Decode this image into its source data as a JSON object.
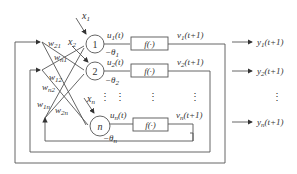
{
  "inputs": [
    "x1",
    "x2",
    "xn"
  ],
  "input_labels": [
    {
      "base": "x",
      "sub": "1"
    },
    {
      "base": "x",
      "sub": "2"
    },
    {
      "base": "x",
      "sub": "n"
    }
  ],
  "neurons": [
    {
      "label": "1",
      "u": {
        "base": "u",
        "sub": "1",
        "arg": "(t)"
      },
      "theta": {
        "base": "−θ",
        "sub": "1"
      },
      "f": "f(·)",
      "v": {
        "base": "v",
        "sub": "1",
        "arg": "(t+1)"
      },
      "y": {
        "base": "y",
        "sub": "1",
        "arg": "(t+1)"
      }
    },
    {
      "label": "2",
      "u": {
        "base": "u",
        "sub": "2",
        "arg": "(t)"
      },
      "theta": {
        "base": "−θ",
        "sub": "2"
      },
      "f": "f(·)",
      "v": {
        "base": "v",
        "sub": "2",
        "arg": "(t+1)"
      },
      "y": {
        "base": "y",
        "sub": "2",
        "arg": "(t+1)"
      }
    },
    {
      "label": "n",
      "u": {
        "base": "u",
        "sub": "n",
        "arg": "(t)"
      },
      "theta": {
        "base": "−θ",
        "sub": "n"
      },
      "f": "f(·)",
      "v": {
        "base": "v",
        "sub": "n",
        "arg": "(t+1)"
      },
      "y": {
        "base": "y",
        "sub": "n",
        "arg": "(t+1)"
      }
    }
  ],
  "weights": [
    {
      "base": "w",
      "sub": "21"
    },
    {
      "base": "w",
      "sub": "n1"
    },
    {
      "base": "w",
      "sub": "12"
    },
    {
      "base": "w",
      "sub": "n2"
    },
    {
      "base": "w",
      "sub": "1n"
    },
    {
      "base": "w",
      "sub": "2n"
    }
  ],
  "ellipsis": "⋮",
  "colors": {
    "line": "#555555",
    "text": "#333333",
    "background": "#ffffff"
  }
}
